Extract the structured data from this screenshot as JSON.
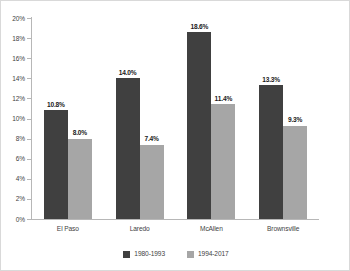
{
  "chart_data": {
    "type": "bar",
    "title": "",
    "subtitle": "",
    "xlabel": "",
    "ylabel": "",
    "categories": [
      "El Paso",
      "Laredo",
      "McAllen",
      "Brownsville"
    ],
    "series": [
      {
        "name": "1980-1993",
        "color": "#404040",
        "values": [
          10.8,
          14.0,
          18.6,
          13.3
        ],
        "labels": [
          "10.8%",
          "14.0%",
          "18.6%",
          "13.3%"
        ]
      },
      {
        "name": "1994-2017",
        "color": "#a6a6a6",
        "values": [
          8.0,
          7.4,
          11.4,
          9.3
        ],
        "labels": [
          "8.0%",
          "7.4%",
          "11.4%",
          "9.3%"
        ]
      }
    ],
    "ylim": [
      0,
      20
    ],
    "ytick_values": [
      0,
      2,
      4,
      6,
      8,
      10,
      12,
      14,
      16,
      18,
      20
    ],
    "ytick_labels": [
      "0%",
      "2%",
      "4%",
      "6%",
      "8%",
      "10%",
      "12%",
      "14%",
      "16%",
      "18%",
      "20%"
    ],
    "grid": false,
    "legend_position": "bottom",
    "axis_color": "#b7b7b7",
    "background_color": "#ffffff"
  }
}
